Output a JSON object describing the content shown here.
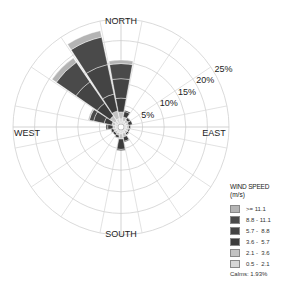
{
  "chart_data": {
    "type": "windrose",
    "title": "",
    "direction_labels": [
      "NORTH",
      "EAST",
      "SOUTH",
      "WEST"
    ],
    "ring_labels": [
      "5%",
      "10%",
      "15%",
      "20%",
      "25%"
    ],
    "rings_percent": [
      5,
      10,
      15,
      20,
      25
    ],
    "max_percent": 25,
    "sectors": 16,
    "sector_directions": [
      "N",
      "NNE",
      "NE",
      "ENE",
      "E",
      "ESE",
      "SE",
      "SSE",
      "S",
      "SSW",
      "SW",
      "WSW",
      "W",
      "WNW",
      "NW",
      "NNW"
    ],
    "speed_classes": [
      {
        "range": "0.5 - 2.1",
        "color": "#d6d6d6"
      },
      {
        "range": "2.1 - 3.6",
        "color": "#c2c2c2"
      },
      {
        "range": "3.6 - 5.7",
        "color": "#3c3c3c"
      },
      {
        "range": "5.7 - 8.8",
        "color": "#444444"
      },
      {
        "range": "8.8 - 11.1",
        "color": "#4a4a4a"
      },
      {
        "range": ">= 11.1",
        "color": "#b4b4b4"
      }
    ],
    "series": [
      {
        "name": "0.5 - 2.1",
        "values": [
          1.2,
          0.8,
          0.7,
          0.6,
          0.6,
          0.6,
          0.6,
          0.8,
          0.9,
          0.7,
          0.6,
          0.6,
          0.6,
          0.7,
          1.0,
          1.3
        ]
      },
      {
        "name": "2.1 - 3.6",
        "values": [
          1.6,
          0.9,
          0.6,
          0.5,
          0.5,
          0.5,
          0.5,
          0.9,
          1.2,
          0.6,
          0.5,
          0.5,
          0.6,
          0.8,
          1.4,
          1.8
        ]
      },
      {
        "name": "3.6 - 5.7",
        "values": [
          3.2,
          1.3,
          0.6,
          0.9,
          0.4,
          0.3,
          0.4,
          1.0,
          2.4,
          0.6,
          0.5,
          0.6,
          1.2,
          1.8,
          3.6,
          4.0
        ]
      },
      {
        "name": "5.7 - 8.8",
        "values": [
          4.5,
          0.3,
          0.1,
          0.0,
          0.0,
          0.0,
          0.1,
          0.2,
          0.3,
          0.1,
          0.0,
          0.1,
          0.4,
          2.5,
          6.0,
          7.0
        ]
      },
      {
        "name": "8.8 - 11.1",
        "values": [
          3.5,
          0.0,
          0.0,
          0.0,
          0.0,
          0.0,
          0.0,
          0.0,
          0.0,
          0.0,
          0.0,
          0.0,
          0.0,
          1.0,
          5.5,
          6.5
        ]
      },
      {
        "name": ">= 11.1",
        "values": [
          0.8,
          0.0,
          0.0,
          0.0,
          0.0,
          0.0,
          0.0,
          0.0,
          0.0,
          0.0,
          0.0,
          0.0,
          0.0,
          0.3,
          1.2,
          1.5
        ]
      }
    ],
    "calms_percent": 1.93,
    "legend_position": "bottom-right",
    "grid": true
  },
  "legend": {
    "title": "WIND SPEED",
    "unit": "(m/s)",
    "items": [
      {
        "range": ">= 11.1",
        "color": "#b4b4b4"
      },
      {
        "range": "8.8 - 11.1",
        "color": "#4a4a4a"
      },
      {
        "range": "5.7 -  8.8",
        "color": "#444444"
      },
      {
        "range": "3.6 -  5.7",
        "color": "#3c3c3c"
      },
      {
        "range": "2.1 -  3.6",
        "color": "#c2c2c2"
      },
      {
        "range": "0.5 -  2.1",
        "color": "#d6d6d6"
      }
    ],
    "calms": "Calms: 1.93%"
  },
  "compass": {
    "north": "NORTH",
    "east": "EAST",
    "south": "SOUTH",
    "west": "WEST"
  }
}
